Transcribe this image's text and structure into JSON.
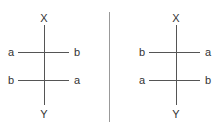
{
  "left_panel": {
    "top_label": "X",
    "bottom_label": "Y",
    "rows": [
      {
        "left": "a",
        "right": "b"
      },
      {
        "left": "b",
        "right": "a"
      }
    ]
  },
  "right_panel": {
    "top_label": "X",
    "bottom_label": "Y",
    "rows": [
      {
        "left": "b",
        "right": "a"
      },
      {
        "left": "a",
        "right": "b"
      }
    ]
  }
}
